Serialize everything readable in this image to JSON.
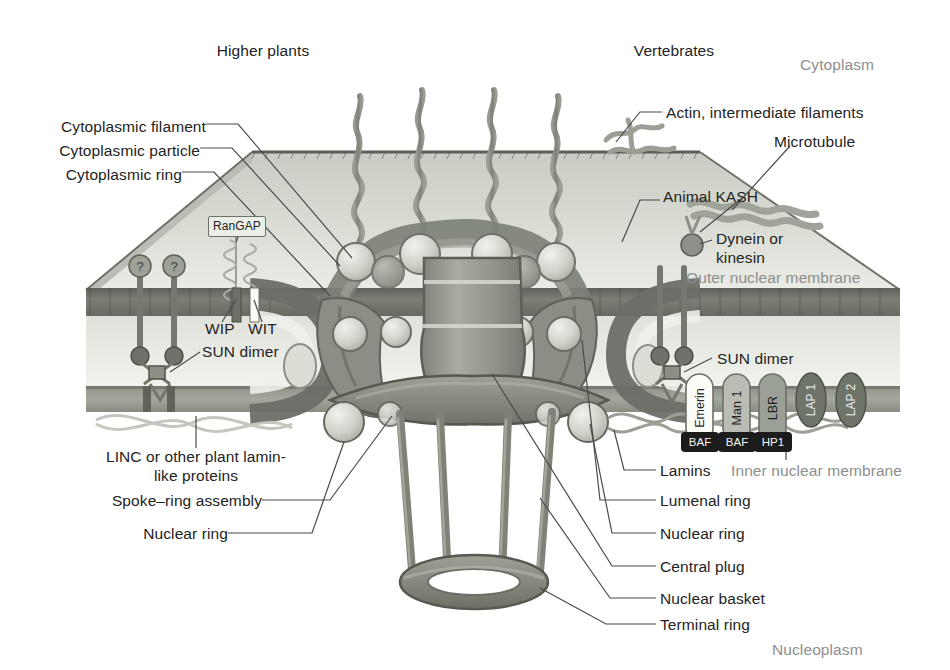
{
  "figure": {
    "compartments": {
      "cytoplasm": "Cytoplasm",
      "nucleoplasm": "Nucleoplasm"
    },
    "organism_headings": {
      "left": "Higher plants",
      "right": "Vertebrates"
    }
  },
  "labels_left": [
    {
      "id": "cytoplasmic-filament",
      "text": "Cytoplasmic filament",
      "x": 46,
      "y": 118
    },
    {
      "id": "cytoplasmic-particle",
      "text": "Cytoplasmic particle",
      "x": 54,
      "y": 142
    },
    {
      "id": "cytoplasmic-ring",
      "text": "Cytoplasmic ring",
      "x": 78,
      "y": 166
    },
    {
      "id": "linc-plant-lamin",
      "text": "LINC or other plant lamin-\nlike proteins",
      "x": 88,
      "y": 453
    },
    {
      "id": "spoke-ring-assembly",
      "text": "Spoke–ring assembly",
      "x": 84,
      "y": 495
    },
    {
      "id": "nuclear-ring-left",
      "text": "Nuclear ring",
      "x": 148,
      "y": 528
    }
  ],
  "labels_right": [
    {
      "id": "actin-intermediate-filaments",
      "text": "Actin, intermediate filaments",
      "x": 668,
      "y": 108
    },
    {
      "id": "microtubule",
      "text": "Microtubule",
      "x": 775,
      "y": 137
    },
    {
      "id": "animal-kash",
      "text": "Animal KASH",
      "x": 665,
      "y": 192
    },
    {
      "id": "dynein-or-kinesin",
      "text": "Dynein or\nkinesin",
      "x": 718,
      "y": 234
    },
    {
      "id": "outer-nuclear-membrane",
      "text": "Outer nuclear membrane",
      "x": 688,
      "y": 273,
      "gray": true
    },
    {
      "id": "sun-dimer-right",
      "text": "SUN dimer",
      "x": 719,
      "y": 354
    },
    {
      "id": "lamins",
      "text": "Lamins",
      "x": 662,
      "y": 466
    },
    {
      "id": "inner-nuclear-membrane",
      "text": "Inner nuclear membrane",
      "x": 733,
      "y": 466,
      "gray": true
    },
    {
      "id": "lumenal-ring",
      "text": "Lumenal ring",
      "x": 662,
      "y": 496
    },
    {
      "id": "nuclear-ring-right",
      "text": "Nuclear ring",
      "x": 662,
      "y": 529
    },
    {
      "id": "central-plug",
      "text": "Central plug",
      "x": 662,
      "y": 562
    },
    {
      "id": "nuclear-basket",
      "text": "Nuclear basket",
      "x": 662,
      "y": 594
    },
    {
      "id": "terminal-ring",
      "text": "Terminal ring",
      "x": 662,
      "y": 620
    }
  ],
  "inline_labels": [
    {
      "id": "rangap",
      "text": "RanGAP",
      "x": 212,
      "y": 222
    },
    {
      "id": "wip",
      "text": "WIP",
      "x": 209,
      "y": 329
    },
    {
      "id": "wit",
      "text": "WIT",
      "x": 250,
      "y": 329
    },
    {
      "id": "sun-dimer-left",
      "text": "SUN dimer",
      "x": 206,
      "y": 352
    }
  ],
  "inm_proteins": [
    {
      "id": "emerin",
      "label": "Emerin",
      "x": 700,
      "y": 385,
      "shape": "capsule",
      "fill": "#fbfbf8",
      "textcolor": "#2a2a2a"
    },
    {
      "id": "man1",
      "label": "Man 1",
      "x": 737,
      "y": 385,
      "shape": "capsule",
      "fill": "#b9bdb4",
      "textcolor": "#23231f"
    },
    {
      "id": "lbr",
      "label": "LBR",
      "x": 773,
      "y": 385,
      "shape": "capsule",
      "fill": "#9aa096",
      "textcolor": "#1e1e1a"
    },
    {
      "id": "lap1",
      "label": "LAP 1",
      "x": 811,
      "y": 398,
      "shape": "oval",
      "fill": "#6f7469",
      "textcolor": "#ececec"
    },
    {
      "id": "lap2",
      "label": "LAP 2",
      "x": 851,
      "y": 398,
      "shape": "oval",
      "fill": "#6f7469",
      "textcolor": "#ececec"
    }
  ],
  "chromatin_badges": [
    {
      "id": "baf-1",
      "label": "BAF",
      "x": 700,
      "y": 443,
      "fill": "#1c1c1c",
      "textcolor": "#f5f5f5"
    },
    {
      "id": "baf-2",
      "label": "BAF",
      "x": 737,
      "y": 443,
      "fill": "#1c1c1c",
      "textcolor": "#f5f5f5"
    },
    {
      "id": "hp1",
      "label": "HP1",
      "x": 773,
      "y": 443,
      "fill": "#1c1c1c",
      "textcolor": "#f5f5f5"
    }
  ],
  "colors": {
    "background": "#ffffff",
    "membrane_dark": "#6b6f66",
    "membrane_mid": "#9b9f94",
    "envelope_light": "#d8dad2",
    "envelope_pale": "#e9eae4",
    "npc_ring": "#8b8f84",
    "npc_ring_dark": "#74786d",
    "particle_light": "#d3d5cc",
    "filament": "#8d9186",
    "leader_line": "#4a4a4a",
    "text": "#232323",
    "text_gray": "#8e8e8e"
  }
}
